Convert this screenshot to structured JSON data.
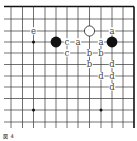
{
  "diagram": {
    "type": "go-board-fragment",
    "caption": "図 4",
    "colors": {
      "line": "#333333",
      "edge": "#111111",
      "black_stone": "#111111",
      "white_stone": "#ffffff",
      "label": "#444444",
      "background": "#ffffff"
    },
    "grid": {
      "cols_x": [
        11,
        22.5,
        33.5,
        45,
        56,
        67,
        78,
        89.5,
        101,
        112,
        123,
        134
      ],
      "rows_y": [
        6.5,
        19,
        31,
        42,
        53,
        64.5,
        76,
        87,
        98.5,
        110,
        122
      ],
      "left_extent": 4,
      "bottom_extent": 128,
      "top_edge": true,
      "right_edge": true
    },
    "star_points": [
      {
        "col": 2,
        "row": 3
      },
      {
        "col": 2,
        "row": 9
      },
      {
        "col": 8,
        "row": 9
      }
    ],
    "stones": [
      {
        "color": "black",
        "col": 4,
        "row": 3
      },
      {
        "color": "white",
        "col": 7,
        "row": 2
      },
      {
        "color": "black",
        "col": 9,
        "row": 3
      }
    ],
    "labels": [
      {
        "text": "e",
        "col": 2,
        "row": 2
      },
      {
        "text": "a",
        "col": 9,
        "row": 2
      },
      {
        "text": "c",
        "col": 5,
        "row": 3
      },
      {
        "text": "a",
        "col": 6,
        "row": 3
      },
      {
        "text": "a",
        "col": 8,
        "row": 3
      },
      {
        "text": "c",
        "col": 5,
        "row": 4
      },
      {
        "text": "b",
        "col": 7,
        "row": 4
      },
      {
        "text": "b",
        "col": 8,
        "row": 4
      },
      {
        "text": "b",
        "col": 7,
        "row": 5
      },
      {
        "text": "d",
        "col": 9,
        "row": 5
      },
      {
        "text": "d",
        "col": 8,
        "row": 6
      },
      {
        "text": "d",
        "col": 9,
        "row": 6
      },
      {
        "text": "d",
        "col": 9,
        "row": 7
      }
    ]
  }
}
